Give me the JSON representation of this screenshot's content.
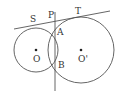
{
  "diagram": {
    "colors": {
      "stroke": "#555555",
      "text": "#333333",
      "background": "#ffffff"
    },
    "circles": [
      {
        "name": "O",
        "cx": 36,
        "cy": 50,
        "r": 22
      },
      {
        "name": "O'",
        "cx": 81,
        "cy": 50,
        "r": 33
      }
    ],
    "lines": [
      {
        "name": "tangent-ST",
        "x1": 14,
        "y1": 29,
        "x2": 110,
        "y2": 11
      },
      {
        "name": "line-PAB",
        "x1": 55,
        "y1": 12,
        "x2": 55,
        "y2": 91
      }
    ],
    "points": [
      {
        "name": "O",
        "x": 36,
        "y": 50
      },
      {
        "name": "O'",
        "x": 81,
        "y": 50
      }
    ],
    "labels": {
      "S": "S",
      "P": "P",
      "T": "T",
      "A": "A",
      "B": "B",
      "O": "O",
      "O_prime": "O'"
    }
  }
}
